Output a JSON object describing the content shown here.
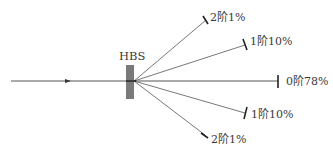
{
  "diagram": {
    "component_label": "HBS",
    "colors": {
      "line": "#555555",
      "beamsplitter": "#7a7a7a",
      "text": "#3a3a3a",
      "background": "#ffffff"
    },
    "input_beam": {
      "direction": "left-to-right"
    },
    "orders": [
      {
        "id": "plus2",
        "label": "2阶1%",
        "order": "2阶",
        "efficiency": "1%"
      },
      {
        "id": "plus1",
        "label": "1阶10%",
        "order": "1阶",
        "efficiency": "10%"
      },
      {
        "id": "zero",
        "label": "0阶78%",
        "order": "0阶",
        "efficiency": "78%"
      },
      {
        "id": "minus1",
        "label": "1阶10%",
        "order": "1阶",
        "efficiency": "10%"
      },
      {
        "id": "minus2",
        "label": "2阶1%",
        "order": "2阶",
        "efficiency": "1%"
      }
    ]
  }
}
